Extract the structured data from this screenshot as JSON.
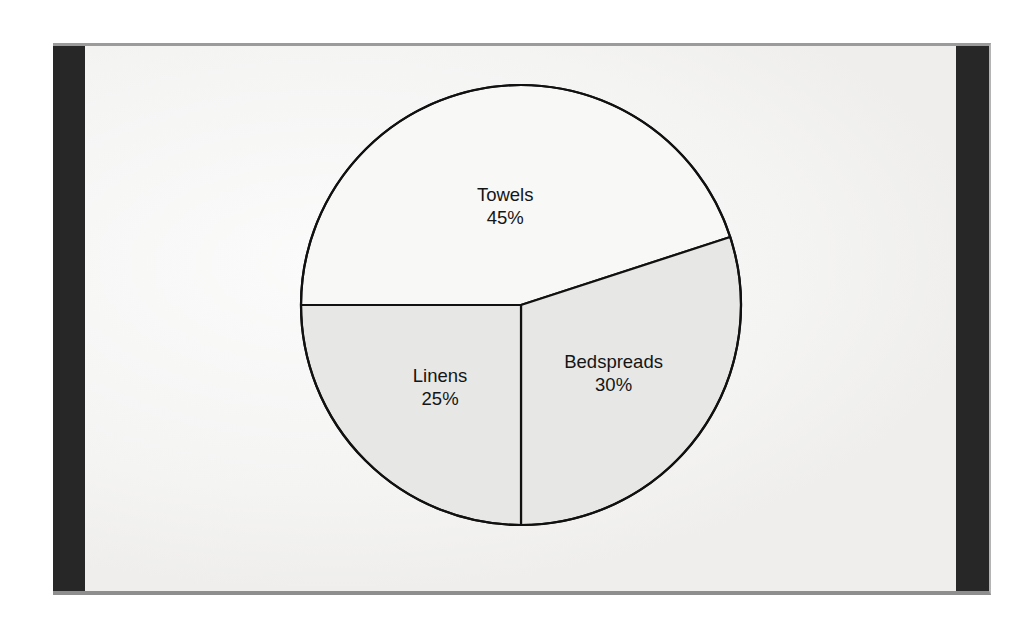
{
  "page": {
    "background_color": "#ffffff",
    "paper_color": "#f6f6f5",
    "gutter_color": "#272727",
    "border_color": "#9b9b9b"
  },
  "chart": {
    "title_line1": "Pavele's Linens",
    "title_line2": "Income from Sales"
  },
  "chart_data": {
    "type": "pie",
    "title": "Pavele's Linens Income from Sales",
    "subtitle": "",
    "xlabel": "",
    "ylabel": "",
    "legend": "none",
    "labels_inside_slices": true,
    "total_percent": 100,
    "categories": [
      "Towels",
      "Bedspreads",
      "Linens"
    ],
    "values": [
      45,
      30,
      25
    ],
    "value_labels": [
      "45%",
      "30%",
      "25%"
    ],
    "slices": [
      {
        "name": "Towels",
        "label": "Towels",
        "value": 45,
        "value_label": "45%",
        "fill": "#f8f8f7",
        "stroke": "#111111",
        "start_angle_deg": 270,
        "end_angle_deg": 432,
        "sweep_deg": 162
      },
      {
        "name": "Bedspreads",
        "label": "Bedspreads",
        "value": 30,
        "value_label": "30%",
        "fill": "#e7e7e5",
        "stroke": "#111111",
        "start_angle_deg": 72,
        "end_angle_deg": 180,
        "sweep_deg": 108
      },
      {
        "name": "Linens",
        "label": "Linens",
        "value": 25,
        "value_label": "25%",
        "fill": "#e7e7e5",
        "stroke": "#111111",
        "start_angle_deg": 180,
        "end_angle_deg": 270,
        "sweep_deg": 90
      }
    ]
  }
}
